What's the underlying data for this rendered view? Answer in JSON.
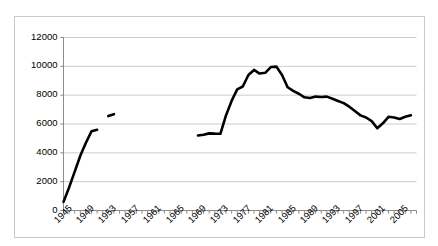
{
  "chart_data": {
    "type": "line",
    "title": "",
    "subtitle": "",
    "xlabel": "",
    "ylabel": "",
    "xlim": [
      1945,
      2008
    ],
    "ylim": [
      0,
      12000
    ],
    "grid": true,
    "legend": false,
    "legend_position": "none",
    "y_ticks": [
      0,
      2000,
      4000,
      6000,
      8000,
      10000,
      12000
    ],
    "y_tick_labels": [
      "0",
      "2000",
      "4000",
      "6000",
      "8000",
      "10000",
      "12000"
    ],
    "x_ticks": [
      1945,
      1949,
      1953,
      1957,
      1961,
      1965,
      1969,
      1973,
      1977,
      1981,
      1985,
      1989,
      1993,
      1997,
      2001,
      2005
    ],
    "x_tick_labels": [
      "1945",
      "1949",
      "1953",
      "1957",
      "1961",
      "1965",
      "1969",
      "1973",
      "1977",
      "1981",
      "1985",
      "1989",
      "1993",
      "1997",
      "2001",
      "2005"
    ],
    "x_minor_tick_step": 1,
    "line_color": "#000000",
    "line_width": 2.6,
    "series": [
      {
        "name": "series-1",
        "has_gaps": true,
        "segments": [
          {
            "name": "segment-1945-1951",
            "x": [
              1945,
              1946,
              1947,
              1948,
              1949,
              1950,
              1951
            ],
            "y": [
              600,
              1600,
              2700,
              3800,
              4700,
              5500,
              5600
            ]
          },
          {
            "name": "segment-1953-1954",
            "x": [
              1953,
              1954
            ],
            "y": [
              6550,
              6680
            ]
          },
          {
            "name": "segment-1969-2007",
            "x": [
              1969,
              1970,
              1971,
              1972,
              1973,
              1974,
              1975,
              1976,
              1977,
              1978,
              1979,
              1980,
              1981,
              1982,
              1983,
              1984,
              1985,
              1986,
              1987,
              1988,
              1989,
              1990,
              1991,
              1992,
              1993,
              1994,
              1995,
              1996,
              1997,
              1998,
              1999,
              2000,
              2001,
              2002,
              2003,
              2004,
              2005,
              2006,
              2007
            ],
            "y": [
              5200,
              5250,
              5350,
              5330,
              5320,
              6600,
              7600,
              8400,
              8600,
              9400,
              9750,
              9500,
              9550,
              9950,
              9980,
              9400,
              8550,
              8300,
              8100,
              7850,
              7800,
              7900,
              7870,
              7900,
              7750,
              7600,
              7450,
              7200,
              6900,
              6600,
              6450,
              6200,
              5700,
              6050,
              6500,
              6450,
              6350,
              6500,
              6600
            ]
          }
        ]
      }
    ],
    "notable_points": {
      "start_value": 600,
      "start_year": 1945,
      "peak_value": 9980,
      "peak_year": 1983,
      "trough_after_peak_value": 5700,
      "trough_after_peak_year": 2001,
      "end_value": 6600,
      "end_year": 2007
    }
  }
}
